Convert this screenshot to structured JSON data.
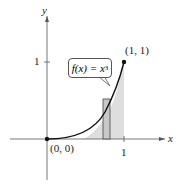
{
  "axes": {
    "x_label": "x",
    "y_label": "y",
    "x_tick": "1",
    "y_tick": "1"
  },
  "points": {
    "origin": "(0, 0)",
    "end": "(1, 1)"
  },
  "function_label": {
    "prefix": "f(x) = x",
    "exponent": "3"
  },
  "colors": {
    "curve": "#111111",
    "shade": "#dcdcdc",
    "axis": "#555555"
  }
}
